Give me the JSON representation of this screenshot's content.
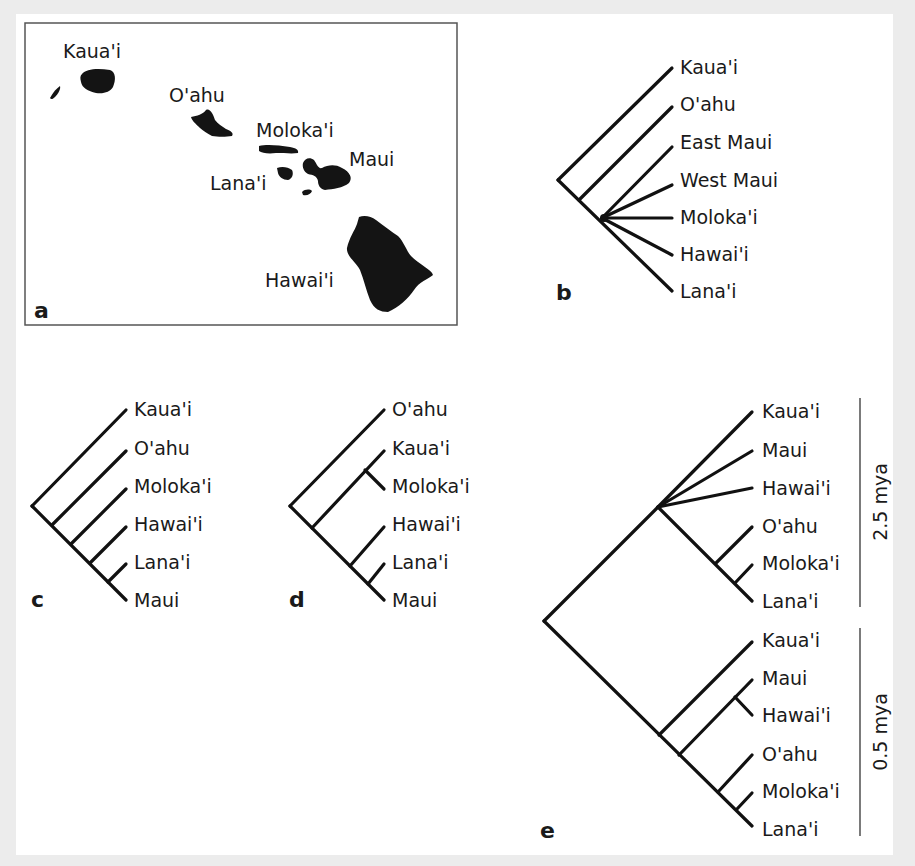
{
  "figure": {
    "panels": {
      "a": {
        "label": "a",
        "type": "map",
        "islands": [
          {
            "name": "Kaua'i"
          },
          {
            "name": "O'ahu"
          },
          {
            "name": "Moloka'i"
          },
          {
            "name": "Maui"
          },
          {
            "name": "Lana'i"
          },
          {
            "name": "Hawai'i"
          }
        ]
      },
      "b": {
        "label": "b",
        "type": "cladogram",
        "taxa": [
          "Kaua'i",
          "O'ahu",
          "East Maui",
          "West Maui",
          "Moloka'i",
          "Hawai'i",
          "Lana'i"
        ]
      },
      "c": {
        "label": "c",
        "type": "cladogram",
        "taxa": [
          "Kaua'i",
          "O'ahu",
          "Moloka'i",
          "Hawai'i",
          "Lana'i",
          "Maui"
        ]
      },
      "d": {
        "label": "d",
        "type": "cladogram",
        "taxa": [
          "O'ahu",
          "Kaua'i",
          "Moloka'i",
          "Hawai'i",
          "Lana'i",
          "Maui"
        ]
      },
      "e": {
        "label": "e",
        "type": "cladogram",
        "upper": {
          "taxa": [
            "Kaua'i",
            "Maui",
            "Hawai'i",
            "O'ahu",
            "Moloka'i",
            "Lana'i"
          ],
          "scale_label": "2.5 mya"
        },
        "lower": {
          "taxa": [
            "Kaua'i",
            "Maui",
            "Hawai'i",
            "O'ahu",
            "Moloka'i",
            "Lana'i"
          ],
          "scale_label": "0.5 mya"
        }
      }
    }
  }
}
